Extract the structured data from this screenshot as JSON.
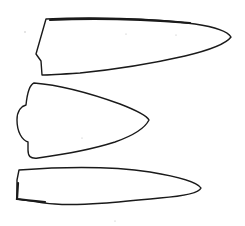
{
  "figure": {
    "background": "#ffffff",
    "stroke_color": "#1a1a1a",
    "items": [
      {
        "name": "blade-1",
        "shape": "long blade with notched butt, pointed right tip"
      },
      {
        "name": "blade-2",
        "shape": "short leaf-shaped point with double-notched rounded base"
      },
      {
        "name": "blade-3",
        "shape": "long slender blade with flat butt, pointed right tip"
      }
    ]
  }
}
